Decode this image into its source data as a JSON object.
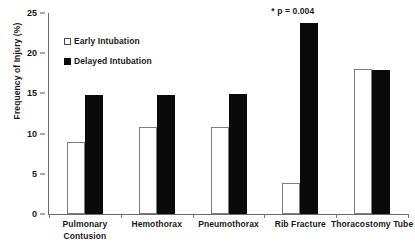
{
  "chart_data": {
    "type": "bar",
    "title": "",
    "xlabel": "",
    "ylabel": "Frequency of Injury (%)",
    "ylim": [
      0,
      25
    ],
    "yticks": [
      0,
      5,
      10,
      15,
      20,
      25
    ],
    "ytick_labels": [
      "0",
      "5",
      "10",
      "15",
      "20",
      "25"
    ],
    "grid": false,
    "legend_position": "upper left",
    "categories": [
      "Pulmonary Contusion",
      "Hemothorax",
      "Pneumothorax",
      "Rib Fracture",
      "Thoracostomy Tube"
    ],
    "category_label_lines": [
      [
        "Pulmonary",
        "Contusion"
      ],
      [
        "Hemothorax"
      ],
      [
        "Pneumothorax"
      ],
      [
        "Rib Fracture"
      ],
      [
        "Thoracostomy Tube"
      ]
    ],
    "series": [
      {
        "name": "Early Intubation",
        "color": "#ffffff",
        "edge_color": "#7d7d7d",
        "values": [
          8.9,
          10.8,
          10.8,
          3.8,
          18.0
        ]
      },
      {
        "name": "Delayed Intubation",
        "color": "#0a0a0a",
        "edge_color": "#0a0a0a",
        "values": [
          14.8,
          14.8,
          14.9,
          23.7,
          17.9
        ]
      }
    ],
    "annotations": [
      {
        "text": "* p = 0.004",
        "category": "Rib Fracture",
        "value": 25.0
      }
    ]
  },
  "legend": {
    "items": [
      {
        "label": "Early Intubation",
        "swatch": "open-square"
      },
      {
        "label": "Delayed Intubation",
        "swatch": "filled-square"
      }
    ]
  }
}
